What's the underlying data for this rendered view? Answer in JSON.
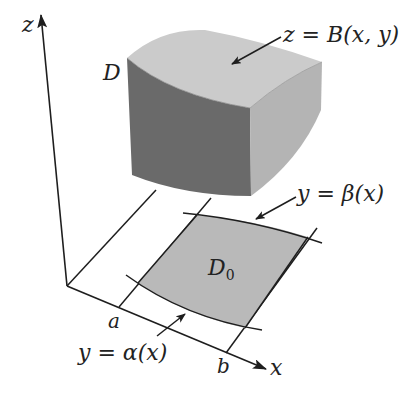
{
  "figure": {
    "type": "3D region bounded above by a surface over a planar base region",
    "colors": {
      "background": "#ffffff",
      "line": "#1e1e1e",
      "top_face": "#c9c9c9",
      "front_face": "#6a6a6a",
      "right_face": "#b4b4b4",
      "base_region": "#b9b9b9"
    }
  },
  "axes": {
    "z": "z",
    "x": "x"
  },
  "labels": {
    "solid": "D",
    "surface": "z = B(x, y)",
    "upper_boundary": "y = β(x)",
    "lower_boundary": "y = α(x)",
    "base_region": "D",
    "base_region_subscript": "0",
    "x_lower": "a",
    "x_upper": "b"
  }
}
